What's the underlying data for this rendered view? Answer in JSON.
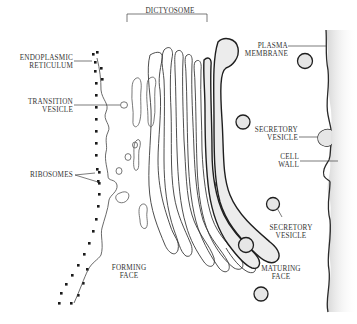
{
  "diagram": {
    "labels": {
      "dictyosome": "DICTYOSOME",
      "endoplasmic_reticulum": [
        "ENDOPLASMIC",
        "RETICULUM"
      ],
      "transition_vesicle": [
        "TRANSITION",
        "VESICLE"
      ],
      "ribosomes": "RIBOSOMES",
      "forming_face": [
        "FORMING",
        "FACE"
      ],
      "plasma_membrane": [
        "PLASMA",
        "MEMBRANE"
      ],
      "secretory_vesicle_top": [
        "SECRETORY",
        "VESICLE"
      ],
      "cell_wall": [
        "CELL",
        "WALL"
      ],
      "secretory_vesicle_bottom": [
        "SECRETORY",
        "VESICLE"
      ],
      "maturing_face": [
        "MATURING",
        "FACE"
      ]
    },
    "colors": {
      "line": "#2a2a2a",
      "vesicle_fill": "#e6e6e6",
      "cell_wall_shade": "#d8d8d8",
      "label_text": "#333333"
    }
  }
}
